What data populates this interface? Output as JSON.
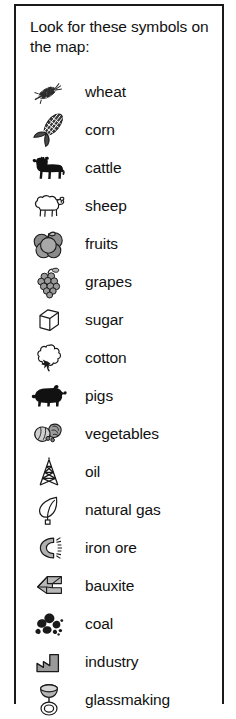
{
  "legend": {
    "title": "Look for these symbols on\nthe map:",
    "border_color": "#1a1a1a",
    "background_color": "#ffffff",
    "text_color": "#111111",
    "items": [
      {
        "icon": "wheat-icon",
        "label": "wheat"
      },
      {
        "icon": "corn-icon",
        "label": "corn"
      },
      {
        "icon": "cattle-icon",
        "label": "cattle"
      },
      {
        "icon": "sheep-icon",
        "label": "sheep"
      },
      {
        "icon": "fruits-icon",
        "label": "fruits"
      },
      {
        "icon": "grapes-icon",
        "label": "grapes"
      },
      {
        "icon": "sugar-icon",
        "label": "sugar"
      },
      {
        "icon": "cotton-icon",
        "label": "cotton"
      },
      {
        "icon": "pigs-icon",
        "label": "pigs"
      },
      {
        "icon": "vegetables-icon",
        "label": "vegetables"
      },
      {
        "icon": "oil-icon",
        "label": "oil"
      },
      {
        "icon": "natural-gas-icon",
        "label": "natural gas"
      },
      {
        "icon": "iron-ore-icon",
        "label": "iron ore"
      },
      {
        "icon": "bauxite-icon",
        "label": "bauxite"
      },
      {
        "icon": "coal-icon",
        "label": "coal"
      },
      {
        "icon": "industry-icon",
        "label": "industry"
      },
      {
        "icon": "glassmaking-icon",
        "label": "glassmaking"
      }
    ]
  }
}
